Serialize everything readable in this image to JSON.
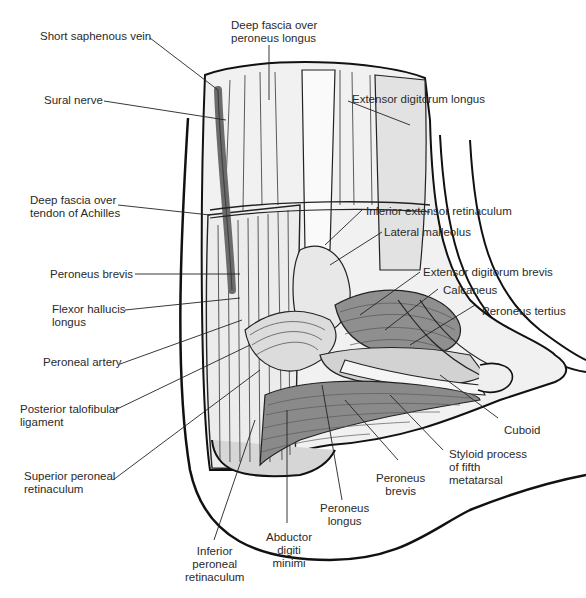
{
  "figure": {
    "colors": {
      "outline": "#111111",
      "fill_light": "#f2f2f2",
      "fill_mid": "#d9d9d9",
      "muscle": "#8a8a8a",
      "vein": "#6b6b6b",
      "label_text": "#2a2a2a"
    }
  },
  "labels": {
    "short_saphenous_vein": "Short saphenous vein",
    "deep_fascia_peroneus_longus": "Deep fascia over\nperoneus longus",
    "sural_nerve": "Sural nerve",
    "extensor_digitorum_longus": "Extensor digitorum longus",
    "deep_fascia_achilles": "Deep fascia over\ntendon of Achilles",
    "inferior_extensor_retinaculum": "Inferior extensor retinaculum",
    "lateral_malleolus": "Lateral malleolus",
    "peroneus_brevis_left": "Peroneus brevis",
    "extensor_digitorum_brevis": "Extensor digitorum brevis",
    "calcaneus": "Calcaneus",
    "flexor_hallucis_longus": "Flexor hallucis\nlongus",
    "peroneus_tertius": "Peroneus tertius",
    "peroneal_artery": "Peroneal artery",
    "posterior_talofibular_ligament": "Posterior talofibular\nligament",
    "cuboid": "Cuboid",
    "superior_peroneal_retinaculum": "Superior peroneal\nretinaculum",
    "styloid_process": "Styloid process\nof fifth\nmetatarsal",
    "peroneus_brevis_bottom": "Peroneus\nbrevis",
    "peroneus_longus": "Peroneus\nlongus",
    "abductor_digiti_minimi": "Abductor\ndigiti\nminimi",
    "inferior_peroneal_retinaculum": "Inferior\nperoneal\nretinaculum"
  }
}
